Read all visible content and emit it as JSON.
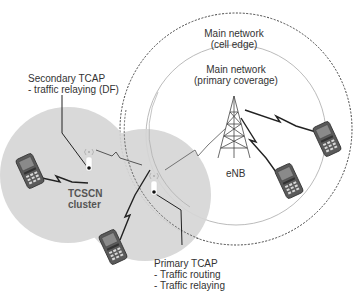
{
  "diagram": {
    "title": "",
    "regions": {
      "cell_edge": {
        "label_line1": "Main network",
        "label_line2": "(cell edge)",
        "style": "dashed-circle"
      },
      "primary_coverage": {
        "label_line1": "Main network",
        "label_line2": "(primary coverage)",
        "style": "thin-circle"
      },
      "tcscn_cluster": {
        "label_line1": "TCSCN",
        "label_line2": "cluster",
        "fill": "#d9d9d9"
      }
    },
    "nodes": {
      "enb": {
        "label": "eNB",
        "icon": "cell-tower-icon"
      },
      "secondary_tcap": {
        "title": "Secondary TCAP",
        "roles": [
          "- traffic relaying (DF)"
        ],
        "icon": "relay-antenna-icon"
      },
      "primary_tcap": {
        "title": "Primary TCAP",
        "roles": [
          "- Traffic routing",
          "- Traffic relaying"
        ],
        "icon": "relay-antenna-icon"
      },
      "phones": [
        {
          "id": "phone-cluster-left",
          "icon": "mobile-phone-icon"
        },
        {
          "id": "phone-cluster-bottom",
          "icon": "mobile-phone-icon"
        },
        {
          "id": "phone-main-right-upper",
          "icon": "mobile-phone-icon"
        },
        {
          "id": "phone-main-right-lower",
          "icon": "mobile-phone-icon"
        }
      ]
    },
    "links": [
      {
        "from": "phone-cluster-left",
        "to": "secondary_tcap",
        "type": "wireless"
      },
      {
        "from": "secondary_tcap",
        "to": "primary_tcap",
        "type": "wireless"
      },
      {
        "from": "phone-cluster-bottom",
        "to": "primary_tcap",
        "type": "wireless"
      },
      {
        "from": "primary_tcap",
        "to": "enb",
        "type": "wireless"
      },
      {
        "from": "enb",
        "to": "phone-main-right-upper",
        "type": "wireless"
      },
      {
        "from": "enb",
        "to": "phone-main-right-lower",
        "type": "wireless"
      }
    ],
    "colors": {
      "cluster_fill": "#d9d9d9",
      "line": "#222222",
      "circle_stroke": "#999999",
      "text": "#333333"
    }
  }
}
